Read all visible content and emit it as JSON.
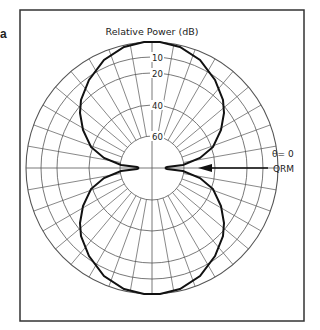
{
  "figure": {
    "panel_letter": "a",
    "title": "Relative Power (dB)",
    "angle_label": "θ= 0",
    "arrow_label": "QRM",
    "colors": {
      "frame": "#333333",
      "grid": "#555555",
      "pattern": "#111111",
      "text": "#222222"
    }
  },
  "chart_data": {
    "type": "polar",
    "title": "Relative Power (dB)",
    "radial_axis": {
      "label": "Relative Power (dB)",
      "ticks": [
        10,
        20,
        40,
        60
      ],
      "rings_db": [
        0,
        10,
        20,
        40,
        60
      ],
      "direction": "decreasing outward-to-inward"
    },
    "angular_grid_deg": 10,
    "annotations": [
      {
        "text": "θ= 0",
        "position": "right, above horizontal axis"
      },
      {
        "text": "QRM",
        "type": "arrow",
        "pointing": "toward center along θ=0"
      }
    ],
    "geometry": {
      "cx": 152,
      "cy": 168,
      "ring_radii": [
        126,
        111,
        95,
        63,
        32
      ],
      "inner_radius": 32,
      "frame": {
        "x": 20,
        "y": 10,
        "w": 284,
        "h": 311
      }
    },
    "series": [
      {
        "name": "figure-eight pattern (nulls at θ=0)",
        "quadrant_points_dxdy": [
          [
            0,
            -126
          ],
          [
            8,
            -126
          ],
          [
            28,
            -121
          ],
          [
            48,
            -108
          ],
          [
            63,
            -88
          ],
          [
            71,
            -68
          ],
          [
            72,
            -55
          ],
          [
            69,
            -38
          ],
          [
            61,
            -21
          ],
          [
            48,
            -10
          ],
          [
            31,
            -3
          ],
          [
            15,
            -1
          ],
          [
            13,
            0
          ]
        ]
      }
    ]
  }
}
